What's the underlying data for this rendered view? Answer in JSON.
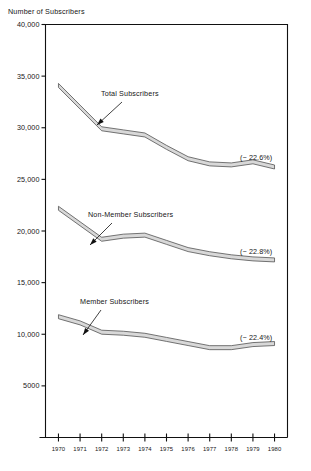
{
  "chart_data": {
    "type": "line",
    "title": "Number of Subscribers",
    "xlabel": "",
    "ylabel": "Number of Subscribers",
    "x": [
      1970,
      1971,
      1972,
      1973,
      1974,
      1975,
      1976,
      1977,
      1978,
      1979,
      1980
    ],
    "xtick_labels": [
      "1970",
      "1971",
      "1972",
      "1973",
      "1974",
      "1975",
      "1976",
      "1977",
      "1978",
      "1979",
      "1980"
    ],
    "ytick_values": [
      5000,
      10000,
      15000,
      20000,
      25000,
      30000,
      35000,
      40000
    ],
    "ytick_labels": [
      "5000",
      "10,000",
      "15,000",
      "20,000",
      "25,000",
      "30,000",
      "35,000",
      "40,000"
    ],
    "ylim": [
      0,
      40000
    ],
    "xlim": [
      1969.4,
      1980.6
    ],
    "grid": false,
    "legend_position": "inline-annotations",
    "band_fill_color": "#d8d8d8",
    "band_stroke_color": "#4a4a4a",
    "series": [
      {
        "name": "Total Subscribers",
        "values": [
          34100,
          32000,
          29900,
          29600,
          29300,
          28100,
          27000,
          26500,
          26400,
          26700,
          26200
        ],
        "change_label": "(− 22.6%)",
        "label": "Total Subscribers"
      },
      {
        "name": "Non-Member Subscribers",
        "values": [
          22200,
          20700,
          19200,
          19500,
          19600,
          18900,
          18200,
          17800,
          17500,
          17300,
          17200
        ],
        "change_label": "(− 22.8%)",
        "label": "Non-Member Subscribers"
      },
      {
        "name": "Member Subscribers",
        "values": [
          11700,
          11100,
          10200,
          10100,
          9900,
          9500,
          9100,
          8700,
          8700,
          9000,
          9100
        ],
        "change_label": "(− 22.4%)",
        "label": "Member Subscribers"
      }
    ],
    "annotations": [
      {
        "text": "Total Subscribers",
        "series": "Total Subscribers"
      },
      {
        "text": "Non-Member Subscribers",
        "series": "Non-Member Subscribers"
      },
      {
        "text": "Member Subscribers",
        "series": "Member Subscribers"
      }
    ]
  }
}
